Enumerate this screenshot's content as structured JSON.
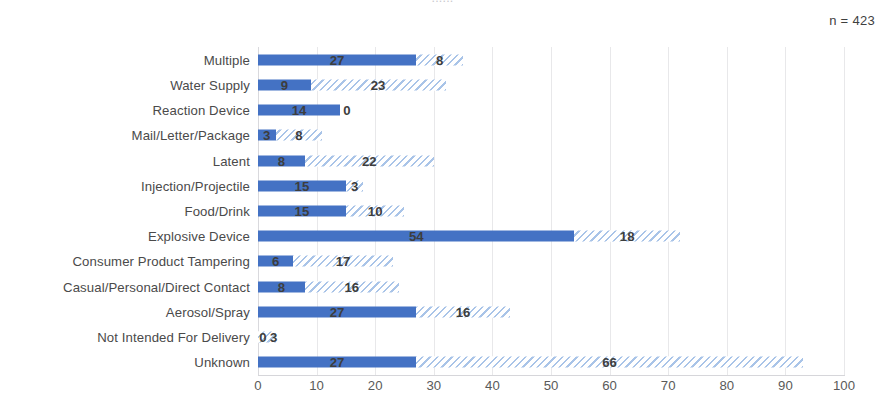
{
  "annotations": {
    "sample_size": "n = 423",
    "clipped_title": "......"
  },
  "colors": {
    "solid_series": "#4472C4",
    "hatched_series": "#A9C4E8",
    "gridline": "#E8E8EA",
    "label_text": "#4A4A4A"
  },
  "chart_data": {
    "type": "bar",
    "orientation": "horizontal",
    "stacked": true,
    "title": "",
    "subtitle": "n = 423",
    "xlabel": "",
    "ylabel": "",
    "xlim": [
      0,
      100
    ],
    "xticks": [
      0,
      10,
      20,
      30,
      40,
      50,
      60,
      70,
      80,
      90,
      100
    ],
    "xtick_labels": [
      "0",
      "10",
      "20",
      "30",
      "40",
      "50",
      "60",
      "70",
      "80",
      "90",
      "100"
    ],
    "grid": true,
    "grid_axis": "x",
    "legend": null,
    "categories": [
      "Multiple",
      "Water Supply",
      "Reaction Device",
      "Mail/Letter/Package",
      "Latent",
      "Injection/Projectile",
      "Food/Drink",
      "Explosive Device",
      "Consumer Product Tampering",
      "Casual/Personal/Direct Contact",
      "Aerosol/Spray",
      "Not Intended For Delivery",
      "Unknown"
    ],
    "series": [
      {
        "name": "series-1-solid",
        "style": "solid",
        "color": "#4472C4",
        "values": [
          27,
          9,
          14,
          3,
          8,
          15,
          15,
          54,
          6,
          8,
          27,
          0,
          27
        ]
      },
      {
        "name": "series-2-hatched",
        "style": "hatched",
        "color": "#A9C4E8",
        "values": [
          8,
          23,
          0,
          8,
          22,
          3,
          10,
          18,
          17,
          16,
          16,
          3,
          66
        ]
      }
    ],
    "totals": [
      35,
      32,
      14,
      11,
      30,
      18,
      25,
      72,
      23,
      24,
      43,
      3,
      93
    ]
  }
}
